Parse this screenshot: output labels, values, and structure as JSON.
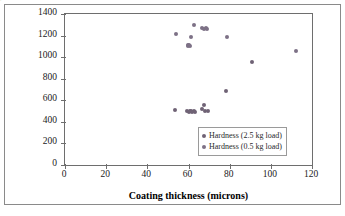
{
  "chart_data": {
    "type": "scatter",
    "title": "",
    "xlabel": "Coating thickness (microns)",
    "ylabel": "Hardness (HV)",
    "xlim": [
      0,
      120
    ],
    "ylim": [
      0,
      1400
    ],
    "xticks": [
      0,
      20,
      40,
      60,
      80,
      100,
      120
    ],
    "yticks": [
      0,
      200,
      400,
      600,
      800,
      1000,
      1200,
      1400
    ],
    "grid": false,
    "legend_position": "inside-lower-right",
    "series": [
      {
        "name": "Hardness (2.5 kg load)",
        "color": "#6f6275",
        "marker": "diamond",
        "points": [
          [
            53.5,
            512
          ],
          [
            59.5,
            500
          ],
          [
            60.2,
            492
          ],
          [
            60.8,
            505
          ],
          [
            61.3,
            497
          ],
          [
            61.8,
            488
          ],
          [
            62.5,
            502
          ],
          [
            63.2,
            496
          ],
          [
            66.5,
            520
          ],
          [
            67.3,
            560
          ],
          [
            68.2,
            505
          ],
          [
            69.5,
            503
          ],
          [
            78.3,
            683
          ],
          [
            91.0,
            958
          ]
        ]
      },
      {
        "name": "Hardness (0.5 kg load)",
        "color": "#7d7186",
        "marker": "circle",
        "points": [
          [
            53.8,
            1216
          ],
          [
            59.7,
            1112
          ],
          [
            59.9,
            1105
          ],
          [
            60.4,
            1110
          ],
          [
            60.6,
            1102
          ],
          [
            61.0,
            1186
          ],
          [
            62.6,
            1300
          ],
          [
            66.8,
            1273
          ],
          [
            67.6,
            1262
          ],
          [
            68.3,
            1268
          ],
          [
            69.0,
            1258
          ],
          [
            78.5,
            1190
          ],
          [
            112.0,
            1053
          ]
        ]
      }
    ],
    "legend": [
      {
        "label": "Hardness (2.5 kg load)",
        "color": "#6f6275"
      },
      {
        "label": "Hardness (0.5 kg load)",
        "color": "#7d7186"
      }
    ]
  }
}
